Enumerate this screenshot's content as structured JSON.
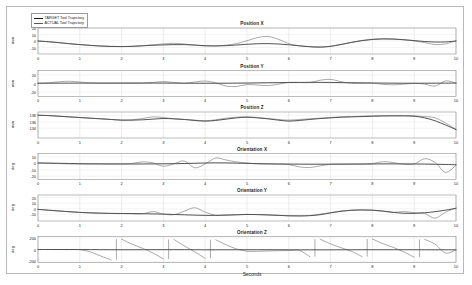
{
  "figure": {
    "xlabel": "Seconds",
    "legend": [
      {
        "label": "TARGET Tool Trajectory",
        "color": "#1a1a1a"
      },
      {
        "label": "ACTUAL Tool Trajectory",
        "color": "#555555"
      }
    ]
  },
  "chart_data": {
    "type": "line",
    "title": "",
    "xlabel": "Seconds",
    "xlim": [
      0,
      10
    ],
    "xticks": [
      0,
      1,
      2,
      3,
      4,
      5,
      6,
      7,
      8,
      9,
      10
    ],
    "grid": true,
    "legend": [
      "TARGET Tool Trajectory",
      "ACTUAL Tool Trajectory"
    ],
    "legend_position": "upper-left-outside",
    "series_colors": {
      "TARGET Tool Trajectory": "#1a1a1a",
      "ACTUAL Tool Trajectory": "#555555"
    },
    "subplots": [
      {
        "title": "Position X",
        "ylabel": "mm",
        "ylim": [
          -20,
          20
        ],
        "yticks": [
          20,
          10,
          0,
          -10
        ],
        "x": [
          0,
          0.25,
          0.5,
          0.75,
          1,
          1.25,
          1.5,
          1.75,
          2,
          2.25,
          2.5,
          2.75,
          3,
          3.25,
          3.5,
          3.75,
          4,
          4.25,
          4.5,
          4.75,
          5,
          5.25,
          5.5,
          5.75,
          6,
          6.25,
          6.5,
          6.75,
          7,
          7.25,
          7.5,
          7.75,
          8,
          8.25,
          8.5,
          8.75,
          9,
          9.25,
          9.5,
          9.75,
          10
        ],
        "series": [
          {
            "name": "TARGET Tool Trajectory",
            "values": [
              0,
              -1.2,
              -2.6,
              -4.2,
              -5.6,
              -6.8,
              -7.8,
              -8.4,
              -8.6,
              -8.2,
              -7.4,
              -6.6,
              -6.0,
              -5.6,
              -5.6,
              -6.2,
              -7.2,
              -7.6,
              -7.2,
              -6.2,
              -5.0,
              -4.2,
              -4.0,
              -4.6,
              -5.8,
              -7.4,
              -8.8,
              -9.4,
              -8.2,
              -5.4,
              -2.2,
              0.6,
              2.4,
              3.2,
              3.0,
              2.0,
              0.6,
              -0.8,
              -1.6,
              -1.4,
              0.0
            ]
          },
          {
            "name": "ACTUAL Tool Trajectory",
            "values": [
              0,
              -1.0,
              -2.4,
              -4.0,
              -5.4,
              -6.6,
              -7.6,
              -8.2,
              -8.6,
              -8.2,
              -7.2,
              -5.8,
              -4.4,
              -3.6,
              -4.6,
              -6.6,
              -7.6,
              -7.4,
              -6.4,
              -4.0,
              0.4,
              5.2,
              7.0,
              2.6,
              -4.0,
              -7.4,
              -8.6,
              -9.2,
              -8.0,
              -5.2,
              -2.0,
              0.8,
              2.6,
              3.4,
              3.0,
              1.8,
              0.2,
              -2.4,
              -5.6,
              -4.4,
              0.2
            ]
          }
        ]
      },
      {
        "title": "Position Y",
        "ylabel": "mm",
        "ylim": [
          -30,
          30
        ],
        "yticks": [
          20,
          0,
          -20
        ],
        "x": [
          0,
          0.25,
          0.5,
          0.75,
          1,
          1.25,
          1.5,
          1.75,
          2,
          2.25,
          2.5,
          2.75,
          3,
          3.25,
          3.5,
          3.75,
          4,
          4.25,
          4.5,
          4.75,
          5,
          5.25,
          5.5,
          5.75,
          6,
          6.25,
          6.5,
          6.75,
          7,
          7.25,
          7.5,
          7.75,
          8,
          8.25,
          8.5,
          8.75,
          9,
          9.25,
          9.5,
          9.75,
          10
        ],
        "series": [
          {
            "name": "TARGET Tool Trajectory",
            "values": [
              0.6,
              0.7,
              0.8,
              0.9,
              1.0,
              1.0,
              1.0,
              1.0,
              1.0,
              1.0,
              1.0,
              1.0,
              1.0,
              0.9,
              0.8,
              0.7,
              0.6,
              0.6,
              0.7,
              0.9,
              1.1,
              1.4,
              1.7,
              2.0,
              2.3,
              2.5,
              2.6,
              2.6,
              2.4,
              2.1,
              1.8,
              1.5,
              1.2,
              1.0,
              0.8,
              0.7,
              0.7,
              0.7,
              0.8,
              0.9,
              1.0
            ]
          },
          {
            "name": "ACTUAL Tool Trajectory",
            "values": [
              0.4,
              1.6,
              4.0,
              5.2,
              3.4,
              1.2,
              0.6,
              0.8,
              0.9,
              0.9,
              1.0,
              2.6,
              4.4,
              2.4,
              0.2,
              3.4,
              5.8,
              1.6,
              -6.0,
              -7.0,
              -2.4,
              -3.6,
              -5.0,
              -1.6,
              2.6,
              2.4,
              2.4,
              7.6,
              9.4,
              4.2,
              0.4,
              0.4,
              0.6,
              -1.8,
              -3.0,
              -1.6,
              0.2,
              -1.4,
              -6.0,
              6.0,
              1.0
            ]
          }
        ]
      },
      {
        "title": "Position Z",
        "ylabel": "mm",
        "ylim": [
          131,
          139
        ],
        "yticks": [
          138,
          136,
          134
        ],
        "x": [
          0,
          0.25,
          0.5,
          0.75,
          1,
          1.25,
          1.5,
          1.75,
          2,
          2.25,
          2.5,
          2.75,
          3,
          3.25,
          3.5,
          3.75,
          4,
          4.25,
          4.5,
          4.75,
          5,
          5.25,
          5.5,
          5.75,
          6,
          6.25,
          6.5,
          6.75,
          7,
          7.25,
          7.5,
          7.75,
          8,
          8.25,
          8.5,
          8.75,
          9,
          9.25,
          9.5,
          9.75,
          10
        ],
        "series": [
          {
            "name": "TARGET Tool Trajectory",
            "values": [
              138.0,
              137.9,
              137.7,
              137.5,
              137.3,
              137.1,
              136.9,
              136.7,
              136.5,
              136.5,
              136.6,
              136.8,
              137.0,
              136.9,
              136.7,
              136.4,
              136.2,
              136.4,
              136.8,
              137.2,
              137.4,
              137.2,
              136.9,
              136.5,
              136.2,
              136.4,
              136.7,
              137.0,
              137.2,
              137.4,
              137.5,
              137.6,
              137.7,
              137.8,
              137.8,
              137.8,
              137.7,
              137.2,
              136.3,
              135.0,
              133.6
            ]
          },
          {
            "name": "ACTUAL Tool Trajectory",
            "values": [
              138.0,
              137.9,
              137.7,
              137.5,
              137.3,
              137.1,
              136.9,
              136.7,
              136.5,
              136.6,
              137.0,
              137.5,
              137.3,
              136.9,
              136.7,
              136.5,
              136.3,
              136.6,
              137.1,
              137.4,
              137.5,
              137.3,
              137.0,
              136.7,
              136.5,
              136.7,
              136.9,
              137.1,
              137.3,
              137.5,
              137.6,
              137.7,
              137.8,
              137.8,
              137.9,
              137.9,
              137.8,
              137.6,
              137.2,
              135.6,
              133.7
            ]
          }
        ]
      },
      {
        "title": "Orientation X",
        "ylabel": "deg",
        "ylim": [
          -25,
          15
        ],
        "yticks": [
          10,
          0,
          -10,
          -20
        ],
        "x": [
          0,
          0.25,
          0.5,
          0.75,
          1,
          1.25,
          1.5,
          1.75,
          2,
          2.25,
          2.5,
          2.75,
          3,
          3.25,
          3.5,
          3.75,
          4,
          4.25,
          4.5,
          4.75,
          5,
          5.25,
          5.5,
          5.75,
          6,
          6.25,
          6.5,
          6.75,
          7,
          7.25,
          7.5,
          7.75,
          8,
          8.25,
          8.5,
          8.75,
          9,
          9.25,
          9.5,
          9.75,
          10
        ],
        "series": [
          {
            "name": "TARGET Tool Trajectory",
            "values": [
              0.4,
              0.2,
              -0.1,
              -0.4,
              -0.7,
              -0.9,
              -1.0,
              -1.1,
              -1.1,
              -1.1,
              -1.1,
              -1.0,
              -0.9,
              -0.7,
              -0.4,
              0.0,
              0.4,
              0.6,
              0.5,
              0.2,
              -0.2,
              -0.6,
              -0.9,
              -1.1,
              -1.3,
              -1.4,
              -1.5,
              -1.5,
              -1.5,
              -1.4,
              -1.3,
              -1.2,
              -1.1,
              -1.0,
              -1.0,
              -1.0,
              -1.1,
              -1.3,
              -1.6,
              -1.9,
              -2.2
            ]
          },
          {
            "name": "ACTUAL Tool Trajectory",
            "values": [
              0.4,
              0.0,
              -0.6,
              -1.0,
              -1.2,
              -1.2,
              -1.1,
              -1.1,
              -1.1,
              -0.4,
              2.2,
              0.6,
              -4.6,
              -1.0,
              3.6,
              -7.0,
              -1.0,
              8.0,
              5.0,
              2.0,
              0.4,
              -1.0,
              -1.2,
              -1.4,
              -2.0,
              -5.6,
              -6.6,
              -4.0,
              -1.6,
              -1.4,
              -1.4,
              -1.4,
              -0.6,
              2.4,
              1.0,
              -1.6,
              -1.2,
              7.0,
              1.2,
              -14.0,
              -3.0
            ]
          }
        ]
      },
      {
        "title": "Orientation Y",
        "ylabel": "deg",
        "ylim": [
          -22,
          25
        ],
        "yticks": [
          20,
          10,
          0,
          -10
        ],
        "x": [
          0,
          0.25,
          0.5,
          0.75,
          1,
          1.25,
          1.5,
          1.75,
          2,
          2.25,
          2.5,
          2.75,
          3,
          3.25,
          3.5,
          3.75,
          4,
          4.25,
          4.5,
          4.75,
          5,
          5.25,
          5.5,
          5.75,
          6,
          6.25,
          6.5,
          6.75,
          7,
          7.25,
          7.5,
          7.75,
          8,
          8.25,
          8.5,
          8.75,
          9,
          9.25,
          9.5,
          9.75,
          10
        ],
        "series": [
          {
            "name": "TARGET Tool Trajectory",
            "values": [
              -1.0,
              -2.4,
              -3.8,
              -5.2,
              -6.4,
              -7.2,
              -7.8,
              -8.2,
              -8.4,
              -8.6,
              -8.8,
              -9.2,
              -9.6,
              -10.2,
              -10.8,
              -11.4,
              -11.8,
              -11.8,
              -11.4,
              -10.8,
              -10.2,
              -10.4,
              -11.0,
              -11.8,
              -12.6,
              -12.8,
              -12.4,
              -10.6,
              -7.4,
              -4.4,
              -2.6,
              -2.0,
              -2.4,
              -4.0,
              -6.4,
              -8.0,
              -8.2,
              -7.2,
              -5.2,
              -2.4,
              1.0
            ]
          },
          {
            "name": "ACTUAL Tool Trajectory",
            "values": [
              -1.0,
              -2.6,
              -4.0,
              -5.4,
              -6.6,
              -7.4,
              -8.0,
              -8.4,
              -8.6,
              -8.8,
              -9.0,
              -5.0,
              -9.4,
              -10.6,
              -4.2,
              2.0,
              -6.0,
              -11.6,
              -11.2,
              -10.6,
              -10.0,
              -10.4,
              -11.0,
              -11.8,
              -12.6,
              -12.8,
              -12.0,
              -9.6,
              -6.8,
              -4.0,
              -2.4,
              -2.0,
              -2.6,
              -4.2,
              -6.4,
              -5.0,
              -7.0,
              -8.4,
              -17.0,
              -6.0,
              1.4
            ]
          }
        ]
      },
      {
        "title": "Orientation Z",
        "ylabel": "deg",
        "ylim": [
          -220,
          220
        ],
        "yticks": [
          200,
          0,
          -200
        ],
        "wrap_degrees": 180,
        "x": [
          0,
          0.25,
          0.5,
          0.75,
          1,
          1.25,
          1.5,
          1.75,
          2,
          2.25,
          2.5,
          2.75,
          3,
          3.25,
          3.5,
          3.75,
          4,
          4.25,
          4.5,
          4.75,
          5,
          5.25,
          5.5,
          5.75,
          6,
          6.25,
          6.5,
          6.75,
          7,
          7.25,
          7.5,
          7.75,
          8,
          8.25,
          8.5,
          8.75,
          9,
          9.25,
          9.5,
          9.75,
          10
        ],
        "series": [
          {
            "name": "TARGET Tool Trajectory",
            "values": [
              0,
              0,
              0,
              0,
              -1,
              -2,
              -3,
              -4,
              -4,
              -4,
              -4,
              -3,
              -3,
              -3,
              -3,
              -4,
              -5,
              -5,
              -5,
              -4,
              -4,
              -4,
              -4,
              -4,
              -5,
              -6,
              -6,
              -6,
              -6,
              -5,
              -5,
              -4,
              -4,
              -4,
              -4,
              -4,
              -4,
              -5,
              -5,
              -5,
              -5
            ]
          },
          {
            "name": "ACTUAL Tool Trajectory",
            "values": [
              0,
              0,
              -1,
              -2,
              -3,
              -40,
              -110,
              -175,
              175,
              90,
              20,
              -60,
              -160,
              170,
              60,
              -40,
              -150,
              165,
              80,
              10,
              -30,
              -30,
              -25,
              -20,
              -18,
              -15,
              -120,
              175,
              95,
              30,
              -30,
              -120,
              178,
              100,
              35,
              -40,
              -130,
              170,
              90,
              -60,
              -5
            ]
          }
        ]
      }
    ]
  }
}
